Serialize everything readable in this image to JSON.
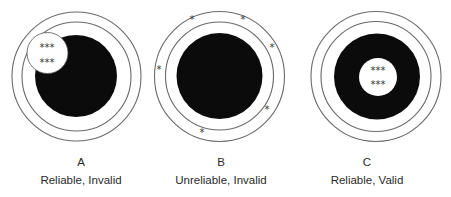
{
  "diagram": {
    "type": "target-reliability-validity",
    "colors": {
      "bullseye": "#0b0b0b",
      "ring": "#6a6a6a",
      "background": "#ffffff"
    },
    "targets": [
      {
        "id": "A",
        "letter": "A",
        "label": "Reliable, Invalid",
        "hit_rows": [
          "***",
          "***"
        ],
        "hit_pattern": "clustered off-center (upper-left)"
      },
      {
        "id": "B",
        "letter": "B",
        "label": "Unreliable, Invalid",
        "hit_marks": [
          "*",
          "*",
          "*",
          "*",
          "*",
          "*"
        ],
        "hit_pattern": "scattered around outer ring"
      },
      {
        "id": "C",
        "letter": "C",
        "label": "Reliable, Valid",
        "hit_rows": [
          "***",
          "***"
        ],
        "hit_pattern": "clustered at center"
      }
    ]
  }
}
